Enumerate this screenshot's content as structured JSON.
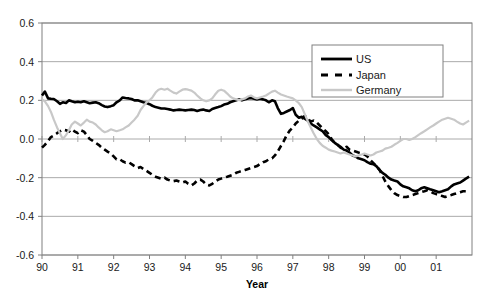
{
  "chart_data": {
    "type": "line",
    "title": "",
    "xlabel": "Year",
    "ylabel": "",
    "xlim": [
      90,
      102
    ],
    "ylim": [
      -0.6,
      0.6
    ],
    "grid": true,
    "legend_position": "top-right",
    "y_ticks": [
      "0.6",
      "0.4",
      "0.2",
      "0.0",
      "-0.2",
      "-0.4",
      "-0.6"
    ],
    "y_tick_values": [
      0.6,
      0.4,
      0.2,
      0.0,
      -0.2,
      -0.4,
      -0.6
    ],
    "x_ticks": [
      "90",
      "91",
      "92",
      "93",
      "94",
      "95",
      "96",
      "97",
      "98",
      "99",
      "00",
      "01"
    ],
    "x_tick_values": [
      90,
      91,
      92,
      93,
      94,
      95,
      96,
      97,
      98,
      99,
      100,
      101
    ],
    "series": [
      {
        "name": "US",
        "color": "#000000",
        "style": "solid",
        "width": 2.6,
        "x": [
          90.0,
          90.08,
          90.17,
          90.25,
          90.33,
          90.42,
          90.5,
          90.58,
          90.67,
          90.75,
          90.83,
          90.92,
          91.0,
          91.08,
          91.17,
          91.25,
          91.33,
          91.42,
          91.5,
          91.58,
          91.67,
          91.75,
          91.83,
          91.92,
          92.0,
          92.08,
          92.17,
          92.25,
          92.33,
          92.42,
          92.5,
          92.58,
          92.67,
          92.75,
          92.83,
          92.92,
          93.0,
          93.08,
          93.17,
          93.25,
          93.33,
          93.42,
          93.5,
          93.58,
          93.67,
          93.75,
          93.83,
          93.92,
          94.0,
          94.08,
          94.17,
          94.25,
          94.33,
          94.42,
          94.5,
          94.58,
          94.67,
          94.75,
          94.83,
          94.92,
          95.0,
          95.08,
          95.17,
          95.25,
          95.33,
          95.42,
          95.5,
          95.58,
          95.67,
          95.75,
          95.83,
          95.92,
          96.0,
          96.08,
          96.17,
          96.25,
          96.33,
          96.42,
          96.5,
          96.58,
          96.67,
          96.75,
          96.83,
          96.92,
          97.0,
          97.08,
          97.17,
          97.25,
          97.33,
          97.42,
          97.5,
          97.58,
          97.67,
          97.75,
          97.83,
          97.92,
          98.0,
          98.08,
          98.17,
          98.25,
          98.33,
          98.42,
          98.5,
          98.58,
          98.67,
          98.75,
          98.83,
          98.92,
          99.0,
          99.08,
          99.17,
          99.25,
          99.33,
          99.42,
          99.5,
          99.58,
          99.67,
          99.75,
          99.83,
          99.92,
          100.0,
          100.08,
          100.17,
          100.25,
          100.33,
          100.42,
          100.5,
          100.58,
          100.67,
          100.75,
          100.83,
          100.92,
          101.0,
          101.08,
          101.17,
          101.25,
          101.33,
          101.42,
          101.5,
          101.58,
          101.67,
          101.75,
          101.83,
          101.92
        ],
        "y": [
          0.225,
          0.245,
          0.21,
          0.208,
          0.207,
          0.195,
          0.182,
          0.19,
          0.186,
          0.2,
          0.195,
          0.19,
          0.193,
          0.19,
          0.195,
          0.19,
          0.185,
          0.188,
          0.19,
          0.185,
          0.175,
          0.168,
          0.165,
          0.17,
          0.175,
          0.19,
          0.2,
          0.215,
          0.212,
          0.21,
          0.207,
          0.2,
          0.2,
          0.195,
          0.19,
          0.186,
          0.18,
          0.172,
          0.165,
          0.162,
          0.158,
          0.158,
          0.155,
          0.152,
          0.148,
          0.15,
          0.152,
          0.15,
          0.148,
          0.15,
          0.152,
          0.15,
          0.145,
          0.15,
          0.152,
          0.148,
          0.145,
          0.155,
          0.16,
          0.165,
          0.17,
          0.178,
          0.182,
          0.19,
          0.195,
          0.2,
          0.205,
          0.2,
          0.205,
          0.21,
          0.212,
          0.208,
          0.205,
          0.208,
          0.205,
          0.2,
          0.19,
          0.2,
          0.195,
          0.16,
          0.13,
          0.135,
          0.142,
          0.15,
          0.16,
          0.125,
          0.11,
          0.115,
          0.105,
          0.095,
          0.08,
          0.07,
          0.06,
          0.05,
          0.04,
          0.02,
          0.01,
          -0.005,
          -0.02,
          -0.03,
          -0.04,
          -0.055,
          -0.06,
          -0.07,
          -0.085,
          -0.09,
          -0.1,
          -0.105,
          -0.11,
          -0.12,
          -0.128,
          -0.13,
          -0.14,
          -0.16,
          -0.175,
          -0.185,
          -0.2,
          -0.21,
          -0.215,
          -0.22,
          -0.235,
          -0.245,
          -0.25,
          -0.255,
          -0.265,
          -0.27,
          -0.265,
          -0.255,
          -0.25,
          -0.255,
          -0.26,
          -0.265,
          -0.27,
          -0.275,
          -0.27,
          -0.265,
          -0.26,
          -0.245,
          -0.235,
          -0.23,
          -0.225,
          -0.215,
          -0.205,
          -0.195
        ]
      },
      {
        "name": "Japan",
        "color": "#000000",
        "style": "dashed",
        "width": 2.6,
        "x": [
          90.0,
          90.08,
          90.17,
          90.25,
          90.33,
          90.42,
          90.5,
          90.58,
          90.67,
          90.75,
          90.83,
          90.92,
          91.0,
          91.08,
          91.17,
          91.25,
          91.33,
          91.42,
          91.5,
          91.58,
          91.67,
          91.75,
          91.83,
          91.92,
          92.0,
          92.08,
          92.17,
          92.25,
          92.33,
          92.42,
          92.5,
          92.58,
          92.67,
          92.75,
          92.83,
          92.92,
          93.0,
          93.08,
          93.17,
          93.25,
          93.33,
          93.42,
          93.5,
          93.58,
          93.67,
          93.75,
          93.83,
          93.92,
          94.0,
          94.08,
          94.17,
          94.25,
          94.33,
          94.42,
          94.5,
          94.58,
          94.67,
          94.75,
          94.83,
          94.92,
          95.0,
          95.08,
          95.17,
          95.25,
          95.33,
          95.42,
          95.5,
          95.58,
          95.67,
          95.75,
          95.83,
          95.92,
          96.0,
          96.08,
          96.17,
          96.25,
          96.33,
          96.42,
          96.5,
          96.58,
          96.67,
          96.75,
          96.83,
          96.92,
          97.0,
          97.08,
          97.17,
          97.25,
          97.33,
          97.42,
          97.5,
          97.58,
          97.67,
          97.75,
          97.83,
          97.92,
          98.0,
          98.08,
          98.17,
          98.25,
          98.33,
          98.42,
          98.5,
          98.58,
          98.67,
          98.75,
          98.83,
          98.92,
          99.0,
          99.08,
          99.17,
          99.25,
          99.33,
          99.42,
          99.5,
          99.58,
          99.67,
          99.75,
          99.83,
          99.92,
          100.0,
          100.08,
          100.17,
          100.25,
          100.33,
          100.42,
          100.5,
          100.58,
          100.67,
          100.75,
          100.83,
          100.92,
          101.0,
          101.08,
          101.17,
          101.25,
          101.33,
          101.42,
          101.5,
          101.58,
          101.67,
          101.75,
          101.83,
          101.92
        ],
        "y": [
          -0.045,
          -0.03,
          -0.01,
          0.01,
          0.018,
          0.03,
          0.04,
          0.048,
          0.045,
          0.038,
          0.05,
          0.038,
          0.03,
          0.045,
          0.038,
          0.02,
          0.0,
          -0.01,
          -0.02,
          -0.03,
          -0.045,
          -0.055,
          -0.065,
          -0.075,
          -0.09,
          -0.105,
          -0.105,
          -0.115,
          -0.122,
          -0.12,
          -0.13,
          -0.14,
          -0.15,
          -0.145,
          -0.155,
          -0.165,
          -0.175,
          -0.185,
          -0.195,
          -0.2,
          -0.205,
          -0.2,
          -0.21,
          -0.215,
          -0.218,
          -0.215,
          -0.22,
          -0.225,
          -0.22,
          -0.232,
          -0.24,
          -0.23,
          -0.215,
          -0.21,
          -0.22,
          -0.235,
          -0.24,
          -0.232,
          -0.22,
          -0.21,
          -0.205,
          -0.2,
          -0.195,
          -0.19,
          -0.185,
          -0.175,
          -0.17,
          -0.165,
          -0.16,
          -0.155,
          -0.15,
          -0.145,
          -0.14,
          -0.13,
          -0.12,
          -0.115,
          -0.105,
          -0.1,
          -0.085,
          -0.065,
          -0.035,
          -0.01,
          0.02,
          0.045,
          0.06,
          0.08,
          0.095,
          0.105,
          0.12,
          0.105,
          0.09,
          0.095,
          0.085,
          0.07,
          0.055,
          0.04,
          0.025,
          0.0,
          -0.02,
          -0.03,
          -0.045,
          -0.05,
          -0.04,
          -0.055,
          -0.06,
          -0.065,
          -0.07,
          -0.075,
          -0.08,
          -0.09,
          -0.11,
          -0.125,
          -0.14,
          -0.16,
          -0.19,
          -0.22,
          -0.245,
          -0.265,
          -0.28,
          -0.29,
          -0.295,
          -0.3,
          -0.3,
          -0.295,
          -0.29,
          -0.285,
          -0.28,
          -0.275,
          -0.27,
          -0.265,
          -0.27,
          -0.28,
          -0.285,
          -0.29,
          -0.295,
          -0.3,
          -0.295,
          -0.29,
          -0.285,
          -0.28,
          -0.275,
          -0.27,
          -0.27,
          -0.268
        ]
      },
      {
        "name": "Germany",
        "color": "#c8c8c8",
        "style": "solid",
        "width": 2.2,
        "x": [
          90.0,
          90.08,
          90.17,
          90.25,
          90.33,
          90.42,
          90.5,
          90.58,
          90.67,
          90.75,
          90.83,
          90.92,
          91.0,
          91.08,
          91.17,
          91.25,
          91.33,
          91.42,
          91.5,
          91.58,
          91.67,
          91.75,
          91.83,
          91.92,
          92.0,
          92.08,
          92.17,
          92.25,
          92.33,
          92.42,
          92.5,
          92.58,
          92.67,
          92.75,
          92.83,
          92.92,
          93.0,
          93.08,
          93.17,
          93.25,
          93.33,
          93.42,
          93.5,
          93.58,
          93.67,
          93.75,
          93.83,
          93.92,
          94.0,
          94.08,
          94.17,
          94.25,
          94.33,
          94.42,
          94.5,
          94.58,
          94.67,
          94.75,
          94.83,
          94.92,
          95.0,
          95.08,
          95.17,
          95.25,
          95.33,
          95.42,
          95.5,
          95.58,
          95.67,
          95.75,
          95.83,
          95.92,
          96.0,
          96.08,
          96.17,
          96.25,
          96.33,
          96.42,
          96.5,
          96.58,
          96.67,
          96.75,
          96.83,
          96.92,
          97.0,
          97.08,
          97.17,
          97.25,
          97.33,
          97.42,
          97.5,
          97.58,
          97.67,
          97.75,
          97.83,
          97.92,
          98.0,
          98.08,
          98.17,
          98.25,
          98.33,
          98.42,
          98.5,
          98.58,
          98.67,
          98.75,
          98.83,
          98.92,
          99.0,
          99.08,
          99.17,
          99.25,
          99.33,
          99.42,
          99.5,
          99.58,
          99.67,
          99.75,
          99.83,
          99.92,
          100.0,
          100.08,
          100.17,
          100.25,
          100.33,
          100.42,
          100.5,
          100.58,
          100.67,
          100.75,
          100.83,
          100.92,
          101.0,
          101.08,
          101.17,
          101.25,
          101.33,
          101.42,
          101.5,
          101.58,
          101.67,
          101.75,
          101.83,
          101.92
        ],
        "y": [
          0.205,
          0.195,
          0.17,
          0.14,
          0.1,
          0.06,
          0.03,
          0.0,
          0.02,
          0.045,
          0.075,
          0.09,
          0.08,
          0.07,
          0.085,
          0.1,
          0.09,
          0.085,
          0.075,
          0.06,
          0.045,
          0.035,
          0.04,
          0.05,
          0.045,
          0.04,
          0.045,
          0.05,
          0.06,
          0.07,
          0.085,
          0.1,
          0.12,
          0.15,
          0.17,
          0.19,
          0.2,
          0.215,
          0.24,
          0.255,
          0.26,
          0.255,
          0.26,
          0.25,
          0.24,
          0.235,
          0.245,
          0.255,
          0.258,
          0.255,
          0.25,
          0.24,
          0.225,
          0.21,
          0.2,
          0.195,
          0.2,
          0.21,
          0.23,
          0.25,
          0.255,
          0.25,
          0.235,
          0.22,
          0.21,
          0.205,
          0.2,
          0.205,
          0.21,
          0.22,
          0.225,
          0.215,
          0.21,
          0.215,
          0.22,
          0.225,
          0.235,
          0.245,
          0.25,
          0.24,
          0.23,
          0.225,
          0.22,
          0.215,
          0.21,
          0.2,
          0.185,
          0.165,
          0.13,
          0.09,
          0.06,
          0.03,
          0.0,
          -0.02,
          -0.035,
          -0.045,
          -0.055,
          -0.06,
          -0.065,
          -0.07,
          -0.075,
          -0.07,
          -0.075,
          -0.08,
          -0.085,
          -0.09,
          -0.085,
          -0.08,
          -0.075,
          -0.08,
          -0.085,
          -0.08,
          -0.07,
          -0.065,
          -0.06,
          -0.05,
          -0.045,
          -0.04,
          -0.03,
          -0.02,
          -0.01,
          0.0,
          0.0,
          -0.005,
          0.0,
          0.01,
          0.02,
          0.03,
          0.04,
          0.05,
          0.06,
          0.07,
          0.08,
          0.09,
          0.1,
          0.105,
          0.11,
          0.105,
          0.1,
          0.09,
          0.08,
          0.075,
          0.085,
          0.095
        ]
      }
    ]
  },
  "legend": {
    "items": [
      {
        "label": "US"
      },
      {
        "label": "Japan"
      },
      {
        "label": "Germany"
      }
    ]
  },
  "axes": {
    "x_title": "Year"
  }
}
